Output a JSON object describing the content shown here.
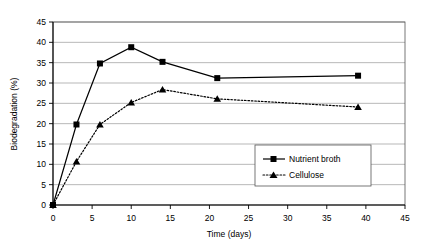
{
  "chart_data": {
    "type": "line",
    "title": "",
    "xlabel": "Time (days)",
    "ylabel": "Biodegradation (%)",
    "xlim": [
      0,
      45
    ],
    "ylim": [
      0,
      45
    ],
    "xticks": [
      0,
      5,
      10,
      15,
      20,
      25,
      30,
      35,
      40,
      45
    ],
    "yticks": [
      0,
      5,
      10,
      15,
      20,
      25,
      30,
      35,
      40,
      45
    ],
    "xtick_labels": [
      "0",
      "5",
      "10",
      "15",
      "20",
      "25",
      "30",
      "35",
      "40",
      "45"
    ],
    "ytick_labels": [
      "0",
      "5",
      "10",
      "15",
      "20",
      "25",
      "30",
      "35",
      "40",
      "45"
    ],
    "grid": "horizontal",
    "legend_position": "inside-lower-right",
    "x": [
      0,
      3,
      6,
      10,
      14,
      21,
      39
    ],
    "series": [
      {
        "name": "Nutrient broth",
        "marker": "square",
        "linestyle": "solid",
        "color": "#000000",
        "values": [
          0,
          19.8,
          34.8,
          38.8,
          35.2,
          31.2,
          31.8
        ]
      },
      {
        "name": "Cellulose",
        "marker": "triangle",
        "linestyle": "dotted",
        "color": "#000000",
        "values": [
          0,
          10.7,
          19.8,
          25.2,
          28.4,
          26.1,
          24.1
        ]
      }
    ]
  },
  "legend": {
    "entries": [
      {
        "label": "Nutrient broth"
      },
      {
        "label": "Cellulose"
      }
    ]
  }
}
